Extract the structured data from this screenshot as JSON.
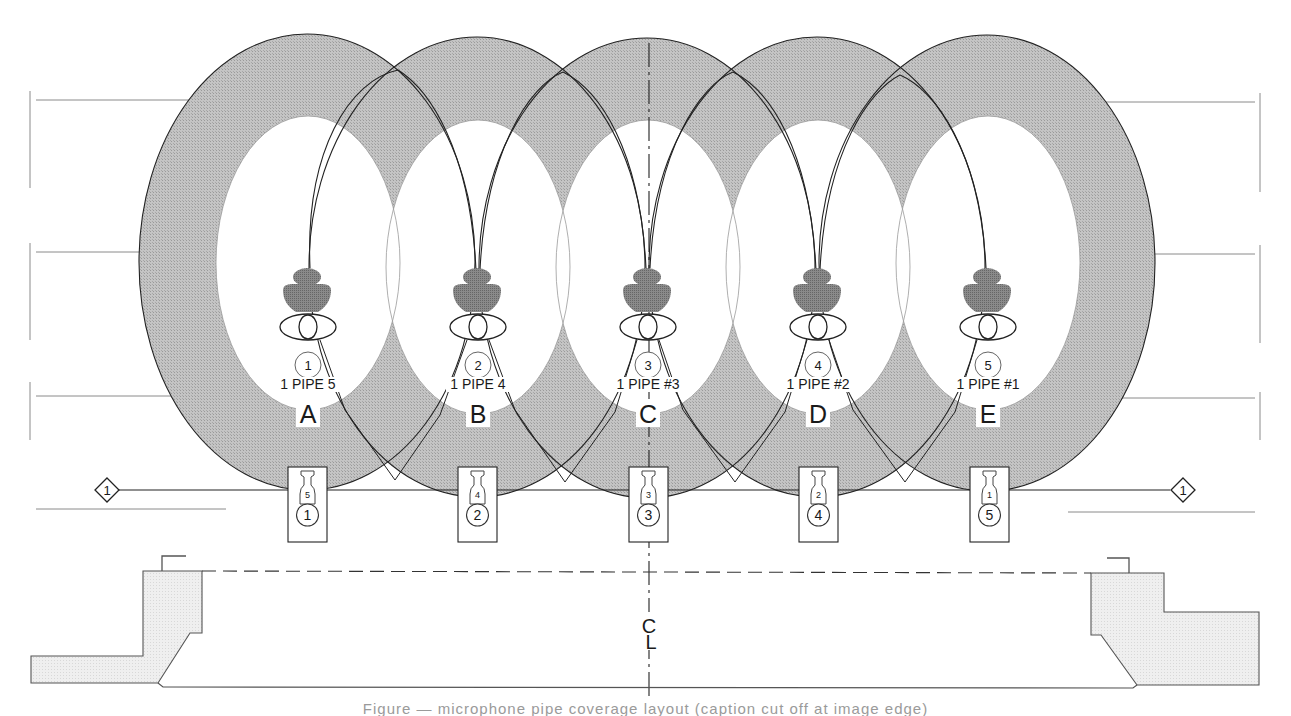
{
  "diagram": {
    "type": "microphone coverage pattern",
    "colors": {
      "coverage_fill": "#b5b5b5",
      "inner_fill": "#ffffff",
      "stroke": "#222222",
      "mic_fill": "#7d7d7d",
      "stage_fill": "#ececec",
      "guide_line": "#8a8a8a"
    },
    "zones": [
      {
        "letter": "A",
        "circle_num": "1",
        "pipe_label": "1 PIPE 5",
        "box_small": "5",
        "box_big": "1"
      },
      {
        "letter": "B",
        "circle_num": "2",
        "pipe_label": "1 PIPE 4",
        "box_small": "4",
        "box_big": "2"
      },
      {
        "letter": "C",
        "circle_num": "3",
        "pipe_label": "1 PIPE #3",
        "box_small": "3",
        "box_big": "3"
      },
      {
        "letter": "D",
        "circle_num": "4",
        "pipe_label": "1 PIPE #2",
        "box_small": "2",
        "box_big": "4"
      },
      {
        "letter": "E",
        "circle_num": "5",
        "pipe_label": "1 PIPE #1",
        "box_small": "1",
        "box_big": "5"
      }
    ],
    "line_markers": {
      "left": "1",
      "right": "1"
    },
    "centerline_label_c": "C",
    "centerline_label_l": "L"
  },
  "caption": "Figure — microphone pipe coverage layout (caption cut off at image edge)"
}
